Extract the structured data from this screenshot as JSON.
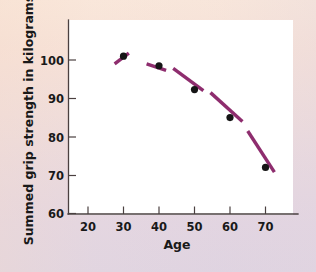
{
  "chart_data": {
    "type": "scatter",
    "title": "",
    "xlabel": "Age",
    "ylabel": "Summed grip strength in kilograms",
    "xlim": [
      15,
      76
    ],
    "ylim": [
      60,
      105
    ],
    "xticks": [
      20,
      30,
      40,
      50,
      60,
      70
    ],
    "yticks": [
      60,
      70,
      80,
      90,
      100
    ],
    "xtick_labels": [
      "20",
      "30",
      "40",
      "50",
      "60",
      "70"
    ],
    "ytick_labels": [
      "60",
      "70",
      "80",
      "90",
      "100"
    ],
    "grid": false,
    "legend": null,
    "x": [
      30,
      40,
      50,
      60,
      70
    ],
    "values": [
      101,
      98.5,
      92.3,
      85,
      72
    ],
    "series": [
      {
        "name": "Summed grip strength",
        "x": [
          30,
          40,
          50,
          60,
          70
        ],
        "values": [
          101,
          98.5,
          92.3,
          85,
          72
        ],
        "marker": "filled-circle",
        "marker_color": "#151515"
      }
    ],
    "trend_line": {
      "name": "fitted curve",
      "style": "dashed",
      "color": "#8e2d6e",
      "segments": [
        {
          "x1": 27.5,
          "y1": 99.0,
          "x2": 31.5,
          "y2": 101.8
        },
        {
          "x1": 36.5,
          "y1": 99.0,
          "x2": 42.0,
          "y2": 97.3
        },
        {
          "x1": 44.0,
          "y1": 97.8,
          "x2": 52.5,
          "y2": 92.0
        },
        {
          "x1": 54.5,
          "y1": 91.5,
          "x2": 63.5,
          "y2": 84.0
        },
        {
          "x1": 65.0,
          "y1": 81.5,
          "x2": 72.5,
          "y2": 70.8
        }
      ]
    },
    "colors": {
      "marker": "#151515",
      "curve": "#8e2d6e",
      "axis": "#4a4040",
      "plot_background": "#ffffff",
      "page_background_top": "#f9e6d9",
      "page_background_bottom": "#ded2e0"
    }
  }
}
